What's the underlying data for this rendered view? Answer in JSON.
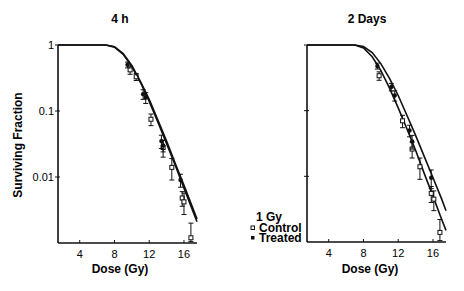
{
  "chart_data": [
    {
      "type": "line",
      "title": "4 h",
      "xlabel": "Dose (Gy)",
      "ylabel": "Surviving Fraction",
      "yscale": "log",
      "xticks": [
        4,
        8,
        12,
        16
      ],
      "yticks": [
        "1",
        "0.1",
        "0.01"
      ],
      "xlim": [
        1.5,
        17.5
      ],
      "ylim": [
        0.001,
        1
      ],
      "grid": false,
      "series": [
        {
          "name": "Control",
          "marker": "open-square",
          "points": [
            {
              "x": 9.8,
              "y": 0.42,
              "err": 0.06
            },
            {
              "x": 10.5,
              "y": 0.33,
              "err": 0.04
            },
            {
              "x": 12.2,
              "y": 0.075,
              "err": 0.015
            },
            {
              "x": 13.6,
              "y": 0.028,
              "err": 0.008
            },
            {
              "x": 14.6,
              "y": 0.014,
              "err": 0.005
            },
            {
              "x": 15.8,
              "y": 0.0048,
              "err": 0.0012
            },
            {
              "x": 16.0,
              "y": 0.0042,
              "err": 0.0015
            },
            {
              "x": 16.8,
              "y": 0.0012,
              "err": 0.0008
            }
          ],
          "fit": [
            [
              1.5,
              1
            ],
            [
              7,
              1
            ],
            [
              8,
              0.93
            ],
            [
              9,
              0.72
            ],
            [
              10,
              0.47
            ],
            [
              11,
              0.27
            ],
            [
              12,
              0.14
            ],
            [
              13,
              0.068
            ],
            [
              14,
              0.032
            ],
            [
              15,
              0.015
            ],
            [
              16,
              0.0068
            ],
            [
              17,
              0.0031
            ],
            [
              17.5,
              0.0021
            ]
          ]
        },
        {
          "name": "Treated",
          "marker": "filled-circle",
          "points": [
            {
              "x": 9.5,
              "y": 0.5,
              "err": 0.05
            },
            {
              "x": 11.3,
              "y": 0.18,
              "err": 0.03
            },
            {
              "x": 11.6,
              "y": 0.16,
              "err": 0.03
            },
            {
              "x": 13.4,
              "y": 0.035,
              "err": 0.008
            },
            {
              "x": 13.6,
              "y": 0.03,
              "err": 0.006
            },
            {
              "x": 15.6,
              "y": 0.009,
              "err": 0.002
            }
          ],
          "fit": [
            [
              1.5,
              1
            ],
            [
              7,
              1
            ],
            [
              8,
              0.94
            ],
            [
              9,
              0.74
            ],
            [
              10,
              0.49
            ],
            [
              11,
              0.28
            ],
            [
              12,
              0.15
            ],
            [
              13,
              0.073
            ],
            [
              14,
              0.035
            ],
            [
              15,
              0.016
            ],
            [
              16,
              0.0075
            ],
            [
              17,
              0.0034
            ],
            [
              17.5,
              0.0023
            ]
          ]
        }
      ]
    },
    {
      "type": "line",
      "title": "2 Days",
      "xlabel": "Dose (Gy)",
      "ylabel": "",
      "yscale": "log",
      "xticks": [
        4,
        8,
        12,
        16
      ],
      "yticks": [
        "",
        "",
        ""
      ],
      "xlim": [
        1.5,
        17.5
      ],
      "ylim": [
        0.001,
        1
      ],
      "grid": false,
      "series": [
        {
          "name": "Control",
          "marker": "open-square",
          "points": [
            {
              "x": 9.8,
              "y": 0.34,
              "err": 0.05
            },
            {
              "x": 12.5,
              "y": 0.07,
              "err": 0.015
            },
            {
              "x": 13.6,
              "y": 0.026,
              "err": 0.007
            },
            {
              "x": 14.5,
              "y": 0.014,
              "err": 0.005
            },
            {
              "x": 15.8,
              "y": 0.0055,
              "err": 0.0015
            },
            {
              "x": 16.1,
              "y": 0.0045,
              "err": 0.0015
            },
            {
              "x": 16.8,
              "y": 0.0014,
              "err": 0.0008
            }
          ],
          "fit": [
            [
              1.5,
              1
            ],
            [
              7,
              1
            ],
            [
              8,
              0.9
            ],
            [
              9,
              0.66
            ],
            [
              10,
              0.41
            ],
            [
              11,
              0.22
            ],
            [
              12,
              0.11
            ],
            [
              13,
              0.053
            ],
            [
              14,
              0.025
            ],
            [
              15,
              0.011
            ],
            [
              16,
              0.005
            ],
            [
              17,
              0.0022
            ],
            [
              17.5,
              0.0015
            ]
          ]
        },
        {
          "name": "Treated",
          "marker": "filled-circle",
          "points": [
            {
              "x": 9.6,
              "y": 0.48,
              "err": 0.05
            },
            {
              "x": 11.2,
              "y": 0.23,
              "err": 0.03
            },
            {
              "x": 11.6,
              "y": 0.17,
              "err": 0.03
            },
            {
              "x": 13.3,
              "y": 0.05,
              "err": 0.01
            },
            {
              "x": 13.6,
              "y": 0.034,
              "err": 0.008
            },
            {
              "x": 15.8,
              "y": 0.0095,
              "err": 0.003
            }
          ],
          "fit": [
            [
              1.5,
              1
            ],
            [
              7,
              1
            ],
            [
              8,
              0.95
            ],
            [
              9,
              0.77
            ],
            [
              10,
              0.52
            ],
            [
              11,
              0.31
            ],
            [
              12,
              0.17
            ],
            [
              13,
              0.085
            ],
            [
              14,
              0.042
            ],
            [
              15,
              0.02
            ],
            [
              16,
              0.0095
            ],
            [
              17,
              0.0045
            ],
            [
              17.5,
              0.003
            ]
          ]
        }
      ]
    }
  ],
  "panels": {
    "left": {
      "title": "4 h",
      "xlabel": "Dose (Gy)",
      "ylabel": "Surviving Fraction",
      "xticks": [
        "4",
        "8",
        "12",
        "16"
      ],
      "yticks": [
        "1",
        "0.1",
        "0.01"
      ]
    },
    "right": {
      "title": "2 Days",
      "xlabel": "Dose (Gy)",
      "xticks": [
        "4",
        "8",
        "12",
        "16"
      ]
    }
  },
  "legend": {
    "title": "1 Gy",
    "items": [
      {
        "label": "Control",
        "marker": "open-square"
      },
      {
        "label": "Treated",
        "marker": "filled-circle"
      }
    ]
  },
  "colors": {
    "ink": "#111111",
    "background": "#ffffff"
  }
}
